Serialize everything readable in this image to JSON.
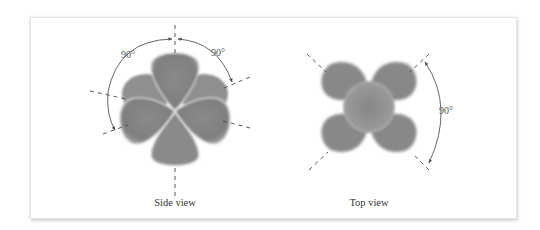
{
  "figure": {
    "panels": [
      {
        "id": "side-view",
        "caption": "Side view",
        "angle_labels": [
          "90°",
          "90°"
        ]
      },
      {
        "id": "top-view",
        "caption": "Top view",
        "angle_labels": [
          "90°"
        ]
      }
    ],
    "colors": {
      "lobe": "#8c8c8c",
      "lobe_dark": "#7a7a7a",
      "lobe_rim": "#d8d8d8",
      "axis_dash": "#444444",
      "arc": "#555555",
      "frame_border": "#e4e4e4"
    }
  }
}
